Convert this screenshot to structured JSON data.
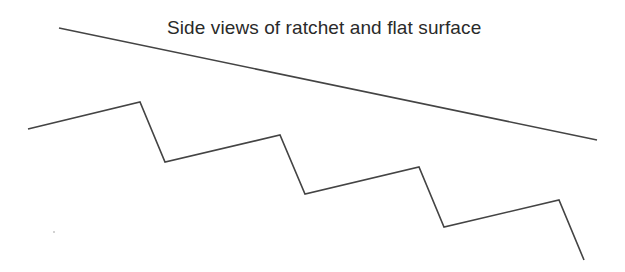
{
  "diagram": {
    "title": "Side views of ratchet and flat surface",
    "stroke_color": "#444444",
    "flat_surface": {
      "points": [
        [
          59,
          28
        ],
        [
          597,
          140
        ]
      ]
    },
    "ratchet": {
      "points": [
        [
          28,
          129
        ],
        [
          140,
          102
        ],
        [
          165,
          162
        ],
        [
          280,
          135
        ],
        [
          305,
          194
        ],
        [
          419,
          167
        ],
        [
          444,
          227
        ],
        [
          559,
          200
        ],
        [
          584,
          260
        ]
      ]
    },
    "speck": [
      54,
      232
    ]
  }
}
